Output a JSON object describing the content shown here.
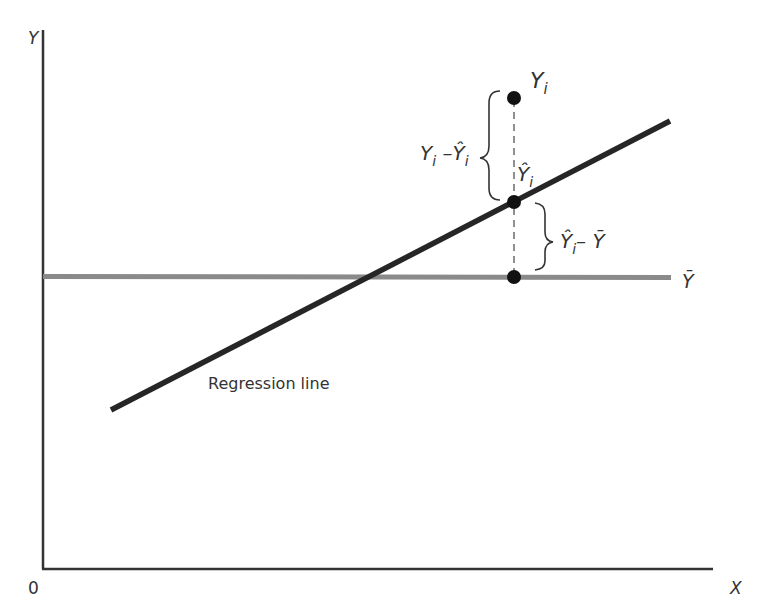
{
  "diagram": {
    "title": "",
    "axes": {
      "y_label": "Y",
      "x_label": "X",
      "origin_label": "0"
    },
    "lines": {
      "mean_line_label": "Ȳ",
      "regression_line_label": "Regression line"
    },
    "points": {
      "observed": "Y",
      "observed_sub": "i",
      "fitted": "Ŷ",
      "fitted_sub": "i"
    },
    "braces": {
      "residual": {
        "a": "Y",
        "a_sub": "i",
        "op": " –",
        "b": "Ŷ",
        "b_sub": "i"
      },
      "explained": {
        "a": "Ŷ",
        "a_sub": "i",
        "op": "– ",
        "b": "Ȳ"
      }
    },
    "colors": {
      "axis": "#333333",
      "regression_line": "#262626",
      "mean_line": "#8a8a8a",
      "points": "#111111",
      "text": "#333333"
    }
  }
}
